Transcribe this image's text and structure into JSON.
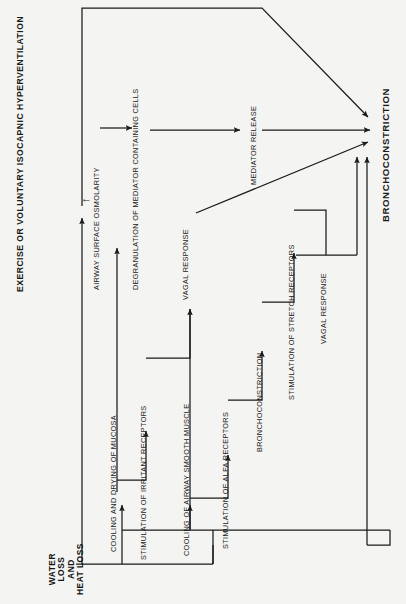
{
  "figure": {
    "title": "EXERCISE OR VOLUNTARY ISOCAPNIC HYPERVENTILATION",
    "background_color": "#f4f4f2",
    "line_color": "#1a1a1a",
    "text_color": "#1a1a1a",
    "orientation": "rotated-90-ccw"
  },
  "nodes": {
    "start": {
      "label_lines": [
        "WATER",
        "LOSS",
        "AND",
        "HEAT LOSS"
      ],
      "label": "WATER LOSS AND HEAT LOSS",
      "emphasis": "bold"
    },
    "osmolarity": {
      "label": "AIRWAY SURFACE OSMOLARITY",
      "marker": "↑"
    },
    "degranulation": {
      "label": "DEGRANULATION OF MEDIATOR CONTAINING CELLS"
    },
    "mediator_release": {
      "label": "MEDIATOR RELEASE"
    },
    "cooling_mucosa": {
      "label": "COOLING AND DRYING OF MUCOSA"
    },
    "irritant_receptors": {
      "label": "STIMULATION OF IRRITANT RECEPTORS"
    },
    "vagal_response_1": {
      "label": "VAGAL RESPONSE"
    },
    "cooling_smooth_muscle": {
      "label": "COOLING OF AIRWAY SMOOTH MUSCLE"
    },
    "alfa_receptors": {
      "label": "STIMULATION OF ALFA RECEPTORS"
    },
    "bronchoconstriction_mid": {
      "label": "BRONCHOCONSTRICTION"
    },
    "stretch_receptors": {
      "label": "STIMULATION OF STRETCH RECEPTORS"
    },
    "vagal_response_2": {
      "label": "VAGAL RESPONSE"
    },
    "outcome": {
      "label": "BRONCHOCONSTRICTION",
      "emphasis": "bold"
    }
  },
  "edges": [
    {
      "from": "start",
      "to": "osmolarity"
    },
    {
      "from": "osmolarity",
      "to": "degranulation"
    },
    {
      "from": "degranulation",
      "to": "mediator_release"
    },
    {
      "from": "mediator_release",
      "to": "outcome"
    },
    {
      "from": "osmolarity",
      "to": "outcome"
    },
    {
      "from": "start",
      "to": "cooling_mucosa"
    },
    {
      "from": "cooling_mucosa",
      "to": "irritant_receptors"
    },
    {
      "from": "irritant_receptors",
      "to": "vagal_response_1"
    },
    {
      "from": "vagal_response_1",
      "to": "outcome"
    },
    {
      "from": "start",
      "to": "cooling_smooth_muscle"
    },
    {
      "from": "cooling_smooth_muscle",
      "to": "alfa_receptors"
    },
    {
      "from": "alfa_receptors",
      "to": "bronchoconstriction_mid"
    },
    {
      "from": "bronchoconstriction_mid",
      "to": "stretch_receptors"
    },
    {
      "from": "stretch_receptors",
      "to": "vagal_response_2"
    },
    {
      "from": "vagal_response_2",
      "to": "outcome"
    },
    {
      "from": "cooling_smooth_muscle",
      "to": "outcome"
    }
  ]
}
